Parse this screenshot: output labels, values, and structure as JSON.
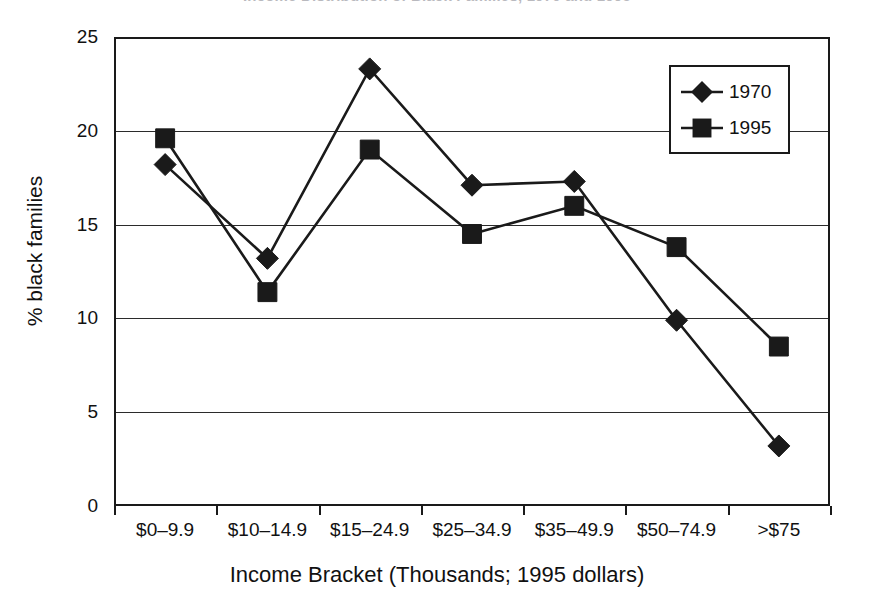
{
  "title_sliver": "Income Distribution of Black Families, 1970 and 1995",
  "legend": {
    "entries": [
      {
        "label": "1970",
        "marker": "diamond-marker"
      },
      {
        "label": "1995",
        "marker": "square-marker"
      }
    ]
  },
  "axes": {
    "y_label": "% black families",
    "y_ticks": [
      "25",
      "20",
      "15",
      "10",
      "5",
      "0"
    ],
    "x_label": "Income Bracket (Thousands; 1995 dollars)"
  },
  "chart_data": {
    "type": "line",
    "title": "Income Distribution of Black Families, 1970 and 1995",
    "xlabel": "Income Bracket (Thousands; 1995 dollars)",
    "ylabel": "% black families",
    "ylim": [
      0,
      25
    ],
    "ytick_values": [
      0,
      5,
      10,
      15,
      20,
      25
    ],
    "grid": true,
    "legend_position": "top-right",
    "categories": [
      "$0–9.9",
      "$10–14.9",
      "$15–24.9",
      "$25–34.9",
      "$35–49.9",
      "$50–74.9",
      ">$75"
    ],
    "series": [
      {
        "name": "1970",
        "marker": "diamond",
        "color": "#1a1a1a",
        "values": [
          18.2,
          13.2,
          23.3,
          17.1,
          17.3,
          9.9,
          3.2
        ]
      },
      {
        "name": "1995",
        "marker": "square",
        "color": "#1a1a1a",
        "values": [
          19.6,
          11.4,
          19.0,
          14.5,
          16.0,
          13.8,
          8.5
        ]
      }
    ]
  }
}
